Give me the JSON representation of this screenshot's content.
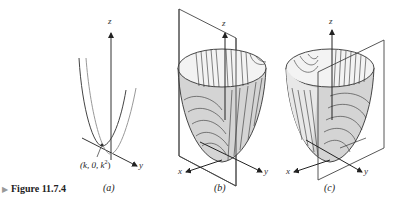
{
  "caption": {
    "marker": "▶",
    "label": "Figure 11.7.4"
  },
  "panels": [
    {
      "id": "a",
      "label": "(a)",
      "axes": {
        "z": "z",
        "y": "y"
      },
      "point_label": {
        "prefix": "(k, 0, k",
        "exp": "2",
        "suffix": ")"
      },
      "description": "Two parabolic traces in vertical planes meeting near point (k, 0, k²)"
    },
    {
      "id": "b",
      "label": "(b)",
      "axes": {
        "z": "z",
        "x": "x",
        "y": "y"
      },
      "description": "Paraboloid surface with vertical cutting plane through the z-axis, showing trace curves"
    },
    {
      "id": "c",
      "label": "(c)",
      "axes": {
        "z": "z",
        "x": "x",
        "y": "y"
      },
      "description": "Paraboloid surface with offset vertical plane parallel to xz-plane, showing trace curves"
    }
  ],
  "colors": {
    "line": "#333333",
    "surface_shade": "#d4d4d4",
    "surface_light": "#f2f2f2",
    "curve_gray": "#9a9a9a"
  }
}
